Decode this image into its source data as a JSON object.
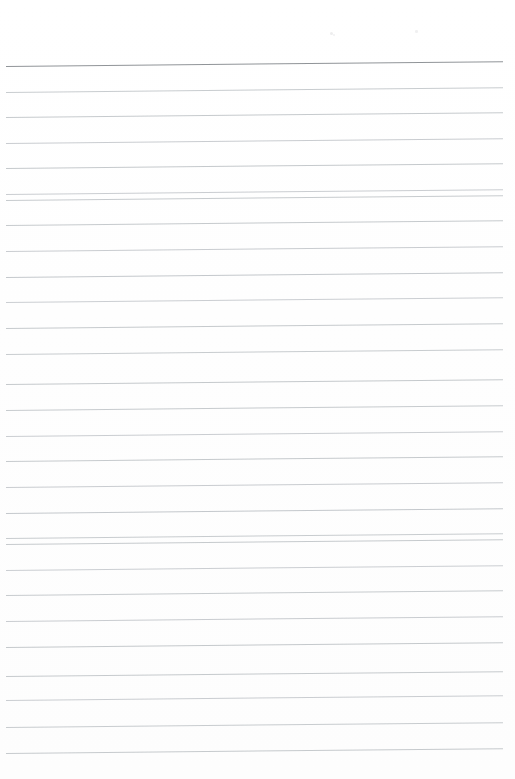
{
  "document": {
    "kind": "scanned-blank-lined-notebook-page",
    "page_width": 515,
    "page_height": 779,
    "background_color": "#fefefe",
    "paper_tone": "#ffffff",
    "has_text_content": false,
    "visible_text": "",
    "orientation": "portrait",
    "scan_skew_degrees": -0.55
  },
  "header": {
    "top_margin_height": 66,
    "title": "",
    "subtitle": "",
    "rule": {
      "label": "header-rule",
      "y": 66,
      "color": "#8a8e92",
      "thickness": 1.8,
      "x_start": 6,
      "x_end": 503
    }
  },
  "footer": {
    "bottom_margin_height": 23,
    "page_number": ""
  },
  "ruling": {
    "style": "wide-ruled",
    "line_color": "#c0c4c8",
    "line_color_light": "#ccd0d4",
    "line_thickness": 1,
    "line_spacing": 25.6,
    "first_line_y": 66,
    "last_line_y": 755,
    "line_count": 28,
    "x_start": 6,
    "x_end": 503,
    "margin_rule": "none",
    "lines": [
      {
        "index": 0,
        "y": 66.0,
        "color": "#8a8e92",
        "thickness": 1.8,
        "x_start": 6,
        "x_end": 503
      },
      {
        "index": 1,
        "y": 91.5,
        "color": "#c2c6ca",
        "thickness": 1,
        "x_start": 6,
        "x_end": 503
      },
      {
        "index": 2,
        "y": 117.0,
        "color": "#c0c4c8",
        "thickness": 1,
        "x_start": 6,
        "x_end": 503
      },
      {
        "index": 3,
        "y": 142.5,
        "color": "#c3c7cb",
        "thickness": 1,
        "x_start": 6,
        "x_end": 503
      },
      {
        "index": 4,
        "y": 168.0,
        "color": "#bfc3c7",
        "thickness": 1,
        "x_start": 6,
        "x_end": 503
      },
      {
        "index": 5,
        "y": 193.5,
        "color": "#c4c8cc",
        "thickness": 1,
        "x_start": 6,
        "x_end": 503
      },
      {
        "index": 6,
        "y": 200.0,
        "color": "#c1c5c9",
        "thickness": 1,
        "x_start": 6,
        "x_end": 503
      },
      {
        "index": 7,
        "y": 225.0,
        "color": "#c0c4c8",
        "thickness": 1,
        "x_start": 6,
        "x_end": 503
      },
      {
        "index": 8,
        "y": 251.0,
        "color": "#c3c7cb",
        "thickness": 1,
        "x_start": 6,
        "x_end": 503
      },
      {
        "index": 9,
        "y": 277.0,
        "color": "#bec2c6",
        "thickness": 1,
        "x_start": 6,
        "x_end": 503
      },
      {
        "index": 10,
        "y": 302.0,
        "color": "#c5c9cd",
        "thickness": 1,
        "x_start": 6,
        "x_end": 503
      },
      {
        "index": 11,
        "y": 328.0,
        "color": "#c0c4c8",
        "thickness": 1,
        "x_start": 6,
        "x_end": 503
      },
      {
        "index": 12,
        "y": 354.0,
        "color": "#c2c6ca",
        "thickness": 1,
        "x_start": 6,
        "x_end": 503
      },
      {
        "index": 13,
        "y": 384.0,
        "color": "#bfc3c7",
        "thickness": 1,
        "x_start": 6,
        "x_end": 503
      },
      {
        "index": 14,
        "y": 410.0,
        "color": "#c1c5c9",
        "thickness": 1,
        "x_start": 6,
        "x_end": 503
      },
      {
        "index": 15,
        "y": 436.0,
        "color": "#c4c8cc",
        "thickness": 1,
        "x_start": 6,
        "x_end": 503
      },
      {
        "index": 16,
        "y": 461.0,
        "color": "#c0c4c8",
        "thickness": 1,
        "x_start": 6,
        "x_end": 503
      },
      {
        "index": 17,
        "y": 487.0,
        "color": "#c3c7cb",
        "thickness": 1,
        "x_start": 6,
        "x_end": 503
      },
      {
        "index": 18,
        "y": 513.0,
        "color": "#bec2c6",
        "thickness": 1,
        "x_start": 6,
        "x_end": 503
      },
      {
        "index": 19,
        "y": 538.0,
        "color": "#c2c6ca",
        "thickness": 1,
        "x_start": 6,
        "x_end": 503
      },
      {
        "index": 20,
        "y": 544.0,
        "color": "#c0c4c8",
        "thickness": 1,
        "x_start": 6,
        "x_end": 503
      },
      {
        "index": 21,
        "y": 570.0,
        "color": "#c5c9cd",
        "thickness": 1,
        "x_start": 6,
        "x_end": 503
      },
      {
        "index": 22,
        "y": 595.0,
        "color": "#c1c5c9",
        "thickness": 1,
        "x_start": 6,
        "x_end": 503
      },
      {
        "index": 23,
        "y": 621.0,
        "color": "#c3c7cb",
        "thickness": 1,
        "x_start": 6,
        "x_end": 503
      },
      {
        "index": 24,
        "y": 647.0,
        "color": "#bfc3c7",
        "thickness": 1,
        "x_start": 6,
        "x_end": 503
      },
      {
        "index": 25,
        "y": 676.0,
        "color": "#c0c4c8",
        "thickness": 1,
        "x_start": 6,
        "x_end": 503
      },
      {
        "index": 26,
        "y": 700.0,
        "color": "#c4c8cc",
        "thickness": 1,
        "x_start": 6,
        "x_end": 503
      },
      {
        "index": 27,
        "y": 727.0,
        "color": "#c2c6ca",
        "thickness": 1,
        "x_start": 6,
        "x_end": 503
      },
      {
        "index": 28,
        "y": 753.0,
        "color": "#c0c4c8",
        "thickness": 1,
        "x_start": 6,
        "x_end": 503
      }
    ]
  },
  "artifacts": {
    "description": "faint scanner dust specks in the blank top margin",
    "specks": [
      {
        "x": 330,
        "y": 32,
        "size": 3.0,
        "color": "#ededee"
      },
      {
        "x": 333,
        "y": 34,
        "size": 2.0,
        "color": "#f1f1f2"
      },
      {
        "x": 415,
        "y": 30,
        "size": 2.5,
        "color": "#f0f0f1"
      }
    ]
  }
}
